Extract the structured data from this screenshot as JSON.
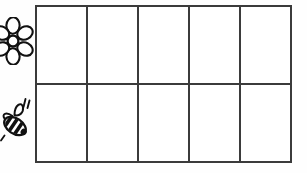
{
  "worksheet": {
    "title": "Flower and bee counting grid",
    "background_color": "#fefefe",
    "line_color": "#3b3b3b"
  },
  "icons": [
    {
      "name": "flower-icon",
      "label": "Flower",
      "row": 1,
      "petals": 6,
      "color": "#111111"
    },
    {
      "name": "bee-icon",
      "label": "Bee",
      "row": 2,
      "stripes": 3,
      "motion_lines": 2,
      "color": "#111111"
    }
  ],
  "grid": {
    "columns": 5,
    "rows": 2,
    "row_labels": [
      "Flower",
      "Bee"
    ],
    "column_labels": [
      "1",
      "2",
      "3",
      "4",
      "5"
    ],
    "cells": [
      [
        "",
        "",
        "",
        "",
        ""
      ],
      [
        "",
        "",
        "",
        "",
        ""
      ]
    ]
  }
}
